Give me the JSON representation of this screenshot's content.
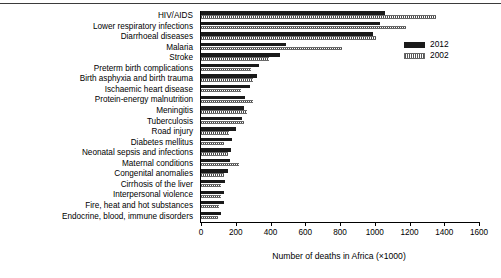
{
  "chart_data": {
    "type": "bar",
    "orientation": "horizontal",
    "title": "",
    "xlabel": "Number of deaths in Africa (×1000)",
    "ylabel": "",
    "xlim": [
      0,
      1600
    ],
    "xticks": [
      0,
      200,
      400,
      600,
      800,
      1000,
      1200,
      1400,
      1600
    ],
    "xticklabels": [
      "0",
      "200",
      "400",
      "600",
      "800",
      "1000",
      "1200",
      "1400",
      "1600"
    ],
    "grid": false,
    "legend_position": "top-right",
    "categories": [
      "HIV/AIDS",
      "Lower respiratory infections",
      "Diarrhoeal diseases",
      "Malaria",
      "Stroke",
      "Preterm birth complications",
      "Birth asphyxia and birth trauma",
      "Ischaemic heart disease",
      "Protein-energy malnutrition",
      "Meningitis",
      "Tuberculosis",
      "Road injury",
      "Diabetes mellitus",
      "Neonatal sepsis and infections",
      "Maternal conditions",
      "Congenital anomalies",
      "Cirrhosis of the liver",
      "Interpersonal violence",
      "Fire, heat and hot substances",
      "Endocrine, blood, immune disorders"
    ],
    "series": [
      {
        "name": "2012",
        "color": "#1a1a1a",
        "values": [
          1060,
          1030,
          990,
          490,
          455,
          335,
          325,
          280,
          255,
          245,
          235,
          200,
          180,
          170,
          165,
          155,
          140,
          135,
          130,
          115
        ]
      },
      {
        "name": "2002",
        "color": "#555555",
        "values": [
          1350,
          1180,
          1010,
          810,
          390,
          290,
          300,
          230,
          300,
          265,
          250,
          160,
          135,
          155,
          220,
          130,
          115,
          115,
          105,
          95
        ]
      }
    ]
  },
  "legend": {
    "entries": [
      {
        "label": "2012",
        "swatch": "solid-black"
      },
      {
        "label": "2002",
        "swatch": "hatched-grey"
      }
    ]
  },
  "axis": {
    "x_title": "Number of deaths in Africa (×1000)"
  }
}
